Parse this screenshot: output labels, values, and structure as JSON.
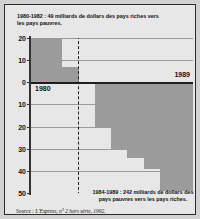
{
  "figure": {
    "caption_top": "1980-1982 : 49 milliards de dollars des pays riches vers les pays pauvres.",
    "caption_bottom": "1984-1989 : 242 milliards de dollars des pays pauvres vers les pays riches.",
    "source": "Source : L'Express, n° 2 hors série, 1992.",
    "label_left": "1980",
    "label_right": "1989",
    "colors": {
      "bar": "#9b9b9b",
      "plot_background": "#e7e7e7",
      "page_background": "#d2d2d2",
      "axis": "#1d1d1d",
      "grid": "#9a9a9a",
      "text": "#111111"
    }
  },
  "chart_data": {
    "type": "bar",
    "xlabel": "",
    "ylabel": "milliards de dollars",
    "categories": [
      "1980",
      "1981",
      "1982",
      "1983",
      "1984",
      "1985",
      "1986",
      "1987",
      "1988",
      "1989"
    ],
    "values": [
      20,
      22,
      7,
      0,
      -20,
      -30,
      -34,
      -39,
      -49,
      -49
    ],
    "ylim": [
      -50,
      20
    ],
    "yticks": [
      20,
      10,
      0,
      -10,
      -20,
      -30,
      -40,
      -50
    ],
    "ytick_labels": [
      "20",
      "10",
      "0",
      "10",
      "20",
      "30",
      "40",
      "50"
    ],
    "grid": true,
    "legend": false,
    "annotations": [
      {
        "text": "1980",
        "position": "below-zero-left"
      },
      {
        "text": "1989",
        "position": "above-zero-right"
      },
      {
        "text": "1980-1982 : 49 milliards de dollars des pays riches vers les pays pauvres.",
        "position": "top"
      },
      {
        "text": "1984-1989 : 242 milliards de dollars des pays pauvres vers les pays riches.",
        "position": "bottom"
      }
    ],
    "dashed_markers": [
      {
        "label": "1983",
        "x_index": 3
      },
      {
        "label": "1989-end",
        "x_index": 10
      }
    ]
  }
}
